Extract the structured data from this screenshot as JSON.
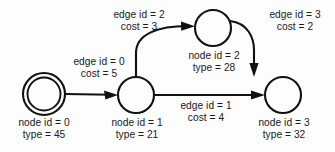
{
  "diagram": {
    "background_color": "#fdfdfd",
    "stroke_color": "#111111",
    "text_color": "#1a1a1a",
    "nodes": [
      {
        "id": "0",
        "shape": "double-circle",
        "label_line1": "node id = 0",
        "label_line2": "type = 45",
        "cx": 44,
        "cy": 94,
        "r": 21,
        "r_inner": 17
      },
      {
        "id": "1",
        "shape": "circle",
        "label_line1": "node id = 1",
        "label_line2": "type = 21",
        "cx": 136,
        "cy": 95,
        "r": 18
      },
      {
        "id": "2",
        "shape": "circle",
        "label_line1": "node id = 2",
        "label_line2": "type = 28",
        "cx": 213,
        "cy": 28,
        "r": 18
      },
      {
        "id": "3",
        "shape": "circle",
        "label_line1": "node id = 3",
        "label_line2": "type = 32",
        "cx": 283,
        "cy": 95,
        "r": 18
      }
    ],
    "edges": [
      {
        "id": "0",
        "from": "0",
        "to": "1",
        "label_line1": "edge id = 0",
        "label_line2": "cost = 5",
        "style": "straight"
      },
      {
        "id": "1",
        "from": "1",
        "to": "3",
        "label_line1": "edge id = 1",
        "label_line2": "cost = 4",
        "style": "straight"
      },
      {
        "id": "2",
        "from": "1",
        "to": "2",
        "label_line1": "edge id = 2",
        "label_line2": "cost = 3",
        "style": "curved-up"
      },
      {
        "id": "3",
        "from": "2",
        "to": "3",
        "label_line1": "edge id = 3",
        "label_line2": "cost = 2",
        "style": "curved-down"
      }
    ]
  }
}
